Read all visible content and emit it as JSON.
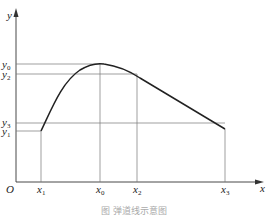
{
  "diagram": {
    "axes": {
      "x_label": "x",
      "y_label": "y",
      "origin_label": "O"
    },
    "x_ticks": [
      {
        "base": "x",
        "sub": "1"
      },
      {
        "base": "x",
        "sub": "0"
      },
      {
        "base": "x",
        "sub": "2"
      },
      {
        "base": "x",
        "sub": "3"
      }
    ],
    "y_ticks": [
      {
        "base": "y",
        "sub": "0"
      },
      {
        "base": "y",
        "sub": "2"
      },
      {
        "base": "y",
        "sub": "3"
      },
      {
        "base": "y",
        "sub": "1"
      }
    ],
    "points": [
      {
        "name": "start",
        "x": "x1",
        "y": "y1"
      },
      {
        "name": "peak",
        "x": "x0",
        "y": "y0"
      },
      {
        "name": "mid",
        "x": "x2",
        "y": "y2"
      },
      {
        "name": "end",
        "x": "x3",
        "y": "y3"
      }
    ],
    "caption": "图  弹道线示意图"
  }
}
